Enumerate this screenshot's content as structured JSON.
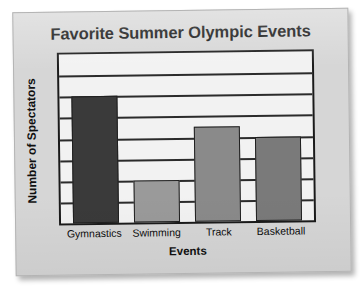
{
  "chart_data": {
    "type": "bar",
    "title": "Favorite Summer Olympic Events",
    "xlabel": "Events",
    "ylabel": "Number of Spectators",
    "categories": [
      "Gymnastics",
      "Swimming",
      "Track",
      "Basketball"
    ],
    "values": [
      6,
      2,
      4.5,
      4
    ],
    "ylim": [
      0,
      8
    ],
    "grid": true,
    "gridline_count": 7,
    "legend": "none",
    "y_tick_labels": [],
    "bar_colors": [
      "#3a3a3a",
      "#9a9a9a",
      "#8a8a8a",
      "#7a7a7a"
    ]
  },
  "card": {
    "background_color": "#d6d6d6",
    "plot_background_color": "#f2f2f2",
    "frame_color": "#1a1a1a"
  }
}
